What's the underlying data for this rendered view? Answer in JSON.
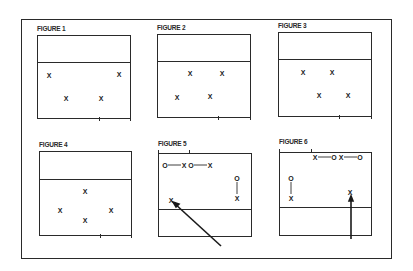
{
  "figures": [
    {
      "label": "FIGURE 1",
      "players": [
        {
          "symbol": "X"
        },
        {
          "symbol": "X"
        },
        {
          "symbol": "X"
        },
        {
          "symbol": "X"
        }
      ]
    },
    {
      "label": "FIGURE 2",
      "players": [
        {
          "symbol": "X"
        },
        {
          "symbol": "X"
        },
        {
          "symbol": "X"
        },
        {
          "symbol": "X"
        }
      ]
    },
    {
      "label": "FIGURE 3",
      "players": [
        {
          "symbol": "X"
        },
        {
          "symbol": "X"
        },
        {
          "symbol": "X"
        },
        {
          "symbol": "X"
        }
      ]
    },
    {
      "label": "FIGURE 4",
      "players": [
        {
          "symbol": "X"
        },
        {
          "symbol": "X"
        },
        {
          "symbol": "X"
        },
        {
          "symbol": "X"
        }
      ]
    },
    {
      "label": "FIGURE 5",
      "players": [
        {
          "symbol": "O"
        },
        {
          "symbol": "X"
        },
        {
          "symbol": "O"
        },
        {
          "symbol": "X"
        },
        {
          "symbol": "O"
        },
        {
          "symbol": "X"
        },
        {
          "symbol": "X"
        }
      ]
    },
    {
      "label": "FIGURE 6",
      "players": [
        {
          "symbol": "X"
        },
        {
          "symbol": "O"
        },
        {
          "symbol": "X"
        },
        {
          "symbol": "O"
        },
        {
          "symbol": "O"
        },
        {
          "symbol": "X"
        },
        {
          "symbol": "X"
        }
      ]
    }
  ]
}
